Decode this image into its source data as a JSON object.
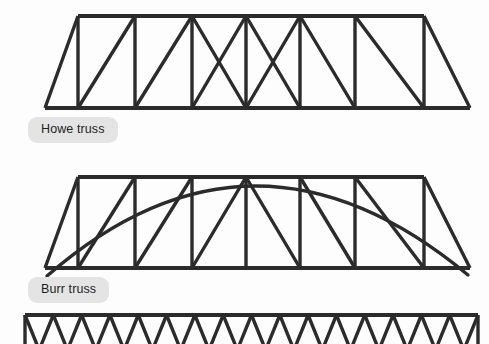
{
  "page": {
    "background_color": "#fdfdfd",
    "line_color": "#2b2b2b",
    "badge_background": "#e4e4e4",
    "badge_text_color": "#1f1f1f"
  },
  "diagrams": [
    {
      "name": "howe-truss",
      "label": "Howe truss",
      "label_x": 28,
      "label_y": 117,
      "type": "trapezoidal-truss",
      "geometry": {
        "bottom_left_x": 45,
        "bottom_right_x": 470,
        "bottom_y": 108,
        "top_left_x": 78,
        "top_right_x": 424,
        "top_y": 16,
        "panel_count": 8,
        "verticals_x": [
          78,
          135,
          192,
          246,
          300,
          355,
          424
        ],
        "diagonal_pattern": "mirrored: left half rises to the right, right half falls to the right, two central panels cross-braced"
      }
    },
    {
      "name": "burr-truss",
      "label": "Burr truss",
      "label_x": 28,
      "label_y": 277,
      "type": "trapezoidal-truss-with-arch",
      "geometry": {
        "bottom_left_x": 45,
        "bottom_right_x": 470,
        "bottom_y": 268,
        "top_left_x": 78,
        "top_right_x": 424,
        "top_y": 177,
        "panel_count": 8,
        "verticals_x": [
          78,
          135,
          192,
          246,
          300,
          355,
          424
        ],
        "diagonal_pattern": "mirrored single diagonals, no cross bracing",
        "arch_left_x": 47,
        "arch_left_y": 276,
        "arch_right_x": 468,
        "arch_right_y": 275,
        "arch_crown_x": 253,
        "arch_crown_y": 186
      }
    },
    {
      "name": "warren-truss",
      "label": "",
      "type": "rectangular-zigzag-truss-cropped",
      "geometry": {
        "left_x": 25,
        "right_x": 478,
        "top_y": 315,
        "bottom_y": 344,
        "zigzag_segments": 16,
        "note": "cropped by bottom edge of frame"
      }
    }
  ]
}
